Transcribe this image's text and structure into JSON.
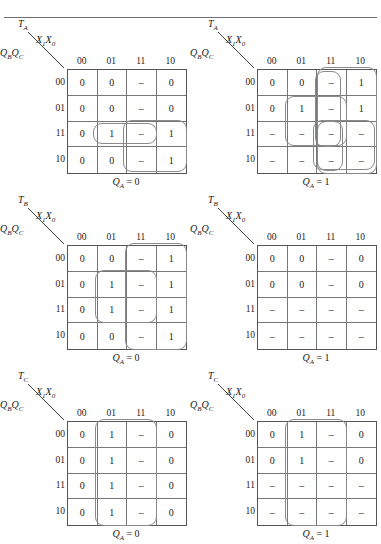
{
  "figure": {
    "rule_label": "horizontal-rule"
  },
  "common": {
    "col_header_var": "X₁X₀",
    "row_header_var": "QʙQᴄ",
    "col_labels": [
      "00",
      "01",
      "11",
      "10"
    ],
    "row_labels": [
      "00",
      "01",
      "11",
      "10"
    ],
    "dash": "–"
  },
  "maps": [
    {
      "id": "map-ta-0",
      "output_var": "T",
      "output_sub": "A",
      "row_var_main": "Q",
      "row_var_sub1": "B",
      "row_var_main2": "Q",
      "row_var_sub2": "C",
      "col_var_main": "X",
      "col_var_sub1": "1",
      "col_var_main2": "X",
      "col_var_sub2": "0",
      "caption_var": "Q",
      "caption_sub": "A",
      "caption_eq": "= 0",
      "cells": [
        [
          "0",
          "0",
          "–",
          "0"
        ],
        [
          "0",
          "0",
          "–",
          "0"
        ],
        [
          "0",
          "1",
          "–",
          "1"
        ],
        [
          "0",
          "0",
          "–",
          "1"
        ]
      ],
      "groups": [
        {
          "name": "group-row11-col01-11",
          "left": 26,
          "top": 54,
          "width": 64,
          "height": 21
        },
        {
          "name": "group-col11-10-row11-10",
          "left": 56,
          "top": 51,
          "width": 64,
          "height": 52
        }
      ]
    },
    {
      "id": "map-ta-1",
      "output_var": "T",
      "output_sub": "A",
      "row_var_main": "Q",
      "row_var_sub1": "B",
      "row_var_main2": "Q",
      "row_var_sub2": "C",
      "col_var_main": "X",
      "col_var_sub1": "1",
      "col_var_main2": "X",
      "col_var_sub2": "0",
      "caption_var": "Q",
      "caption_sub": "A",
      "caption_eq": "= 1",
      "cells": [
        [
          "0",
          "0",
          "–",
          "1"
        ],
        [
          "0",
          "1",
          "–",
          "1"
        ],
        [
          "–",
          "–",
          "–",
          "–"
        ],
        [
          "–",
          "–",
          "–",
          "–"
        ]
      ],
      "groups": [
        {
          "name": "group-col11-rows00-11",
          "left": 58,
          "top": 2,
          "width": 26,
          "height": 76
        },
        {
          "name": "group-col01-11-rows01-11",
          "left": 28,
          "top": 27,
          "width": 62,
          "height": 50
        },
        {
          "name": "group-col11-10-rows11-10",
          "left": 56,
          "top": 51,
          "width": 62,
          "height": 50
        },
        {
          "name": "group-col11-10-rows00-10-wrap",
          "left": 60,
          "top": -2,
          "width": 60,
          "height": 107
        },
        {
          "name": "group-col11-rows11-10-inner",
          "left": 60,
          "top": 52,
          "width": 26,
          "height": 50
        }
      ]
    },
    {
      "id": "map-tb-0",
      "output_var": "T",
      "output_sub": "B",
      "row_var_main": "Q",
      "row_var_sub1": "B",
      "row_var_main2": "Q",
      "row_var_sub2": "C",
      "col_var_main": "X",
      "col_var_sub1": "1",
      "col_var_main2": "X",
      "col_var_sub2": "0",
      "caption_var": "Q",
      "caption_sub": "A",
      "caption_eq": "= 0",
      "cells": [
        [
          "0",
          "0",
          "–",
          "1"
        ],
        [
          "0",
          "1",
          "–",
          "1"
        ],
        [
          "0",
          "1",
          "–",
          "1"
        ],
        [
          "0",
          "0",
          "–",
          "1"
        ]
      ],
      "groups": [
        {
          "name": "group-col11-10-all-rows",
          "left": 58,
          "top": -2,
          "width": 62,
          "height": 107
        },
        {
          "name": "group-col01-11-rows01-11",
          "left": 28,
          "top": 25,
          "width": 62,
          "height": 53
        }
      ]
    },
    {
      "id": "map-tb-1",
      "output_var": "T",
      "output_sub": "B",
      "row_var_main": "Q",
      "row_var_sub1": "B",
      "row_var_main2": "Q",
      "row_var_sub2": "C",
      "col_var_main": "X",
      "col_var_sub1": "1",
      "col_var_main2": "X",
      "col_var_sub2": "0",
      "caption_var": "Q",
      "caption_sub": "A",
      "caption_eq": "= 1",
      "cells": [
        [
          "0",
          "0",
          "–",
          "0"
        ],
        [
          "0",
          "0",
          "–",
          "0"
        ],
        [
          "–",
          "–",
          "–",
          "–"
        ],
        [
          "–",
          "–",
          "–",
          "–"
        ]
      ],
      "groups": []
    },
    {
      "id": "map-tc-0",
      "output_var": "T",
      "output_sub": "C",
      "row_var_main": "Q",
      "row_var_sub1": "B",
      "row_var_main2": "Q",
      "row_var_sub2": "C",
      "col_var_main": "X",
      "col_var_sub1": "1",
      "col_var_main2": "X",
      "col_var_sub2": "0",
      "caption_var": "Q",
      "caption_sub": "A",
      "caption_eq": "= 0",
      "cells": [
        [
          "0",
          "1",
          "–",
          "0"
        ],
        [
          "0",
          "1",
          "–",
          "0"
        ],
        [
          "0",
          "1",
          "–",
          "0"
        ],
        [
          "0",
          "1",
          "–",
          "0"
        ]
      ],
      "groups": [
        {
          "name": "group-col01-11-all-rows",
          "left": 28,
          "top": -2,
          "width": 62,
          "height": 107
        }
      ]
    },
    {
      "id": "map-tc-1",
      "output_var": "T",
      "output_sub": "C",
      "row_var_main": "Q",
      "row_var_sub1": "B",
      "row_var_main2": "Q",
      "row_var_sub2": "C",
      "col_var_main": "X",
      "col_var_sub1": "1",
      "col_var_main2": "X",
      "col_var_sub2": "0",
      "caption_var": "Q",
      "caption_sub": "A",
      "caption_eq": "= 1",
      "cells": [
        [
          "0",
          "1",
          "–",
          "0"
        ],
        [
          "0",
          "1",
          "–",
          "0"
        ],
        [
          "–",
          "–",
          "–",
          "–"
        ],
        [
          "–",
          "–",
          "–",
          "–"
        ]
      ],
      "groups": [
        {
          "name": "group-col01-11-all-rows",
          "left": 28,
          "top": -2,
          "width": 62,
          "height": 107
        }
      ]
    }
  ],
  "colors": {
    "grid_line": "#777777",
    "grid_border": "#555555",
    "oval": "#8a8a8a",
    "rule": "#6f6f6f",
    "text": "#1a1a1a"
  }
}
